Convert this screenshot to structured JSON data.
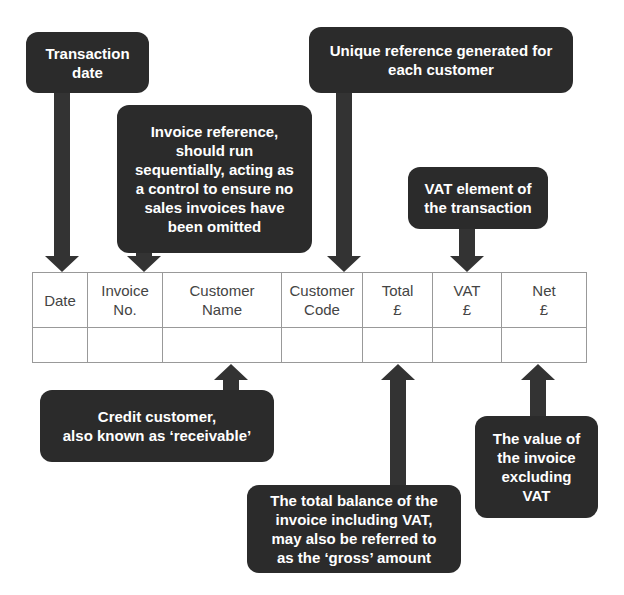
{
  "callouts": {
    "transaction_date": "Transaction\ndate",
    "invoice_reference": "Invoice reference,\nshould run\nsequentially, acting as\na control to ensure no\nsales invoices have\nbeen omitted",
    "customer_code": "Unique reference generated for\neach customer",
    "vat": "VAT element of\nthe transaction",
    "customer_name": "Credit customer,\nalso known as ‘receivable’",
    "total": "The total balance of the\ninvoice including VAT,\nmay also be referred to\nas the ‘gross’ amount",
    "net": "The value of\nthe invoice\nexcluding\nVAT"
  },
  "table": {
    "headers": [
      "Date",
      "Invoice\nNo.",
      "Customer\nName",
      "Customer\nCode",
      "Total\n£",
      "VAT\n£",
      "Net\n£"
    ],
    "rows": [
      [
        "",
        "",
        "",
        "",
        "",
        "",
        ""
      ]
    ]
  },
  "colors": {
    "callout_bg": "#2b2b2b",
    "arrow": "#333333",
    "grid": "#999999",
    "table_text": "#444444"
  }
}
